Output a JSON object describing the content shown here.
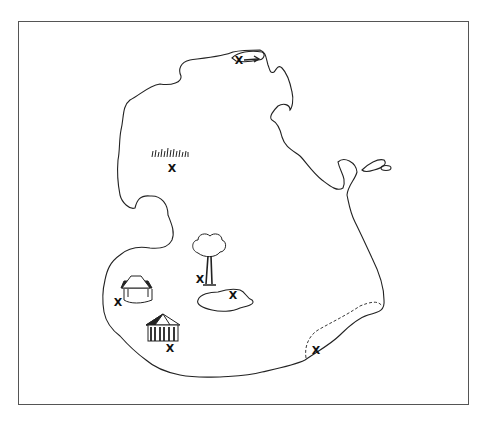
{
  "map": {
    "title": "",
    "frame_color": "#555555",
    "line_color": "#222222",
    "features": [
      {
        "id": "north-cove",
        "icon": "canoe-icon",
        "marker": "x",
        "mark_pos": [
          239,
          60
        ]
      },
      {
        "id": "grassland",
        "icon": "grass-icon",
        "marker": "x",
        "mark_pos": [
          172,
          168
        ]
      },
      {
        "id": "tree",
        "icon": "tree-icon",
        "marker": "x",
        "mark_pos": [
          200,
          279
        ]
      },
      {
        "id": "pond",
        "icon": "pond-icon",
        "marker": "x",
        "mark_pos": [
          233,
          295
        ]
      },
      {
        "id": "well",
        "icon": "well-icon",
        "marker": "x",
        "mark_pos": [
          118,
          301
        ]
      },
      {
        "id": "hut",
        "icon": "hut-icon",
        "marker": "x",
        "mark_pos": [
          170,
          348
        ]
      },
      {
        "id": "beach",
        "icon": "beach-zone-icon",
        "marker": "x",
        "mark_pos": [
          316,
          350
        ]
      }
    ],
    "marker_label": "X"
  }
}
